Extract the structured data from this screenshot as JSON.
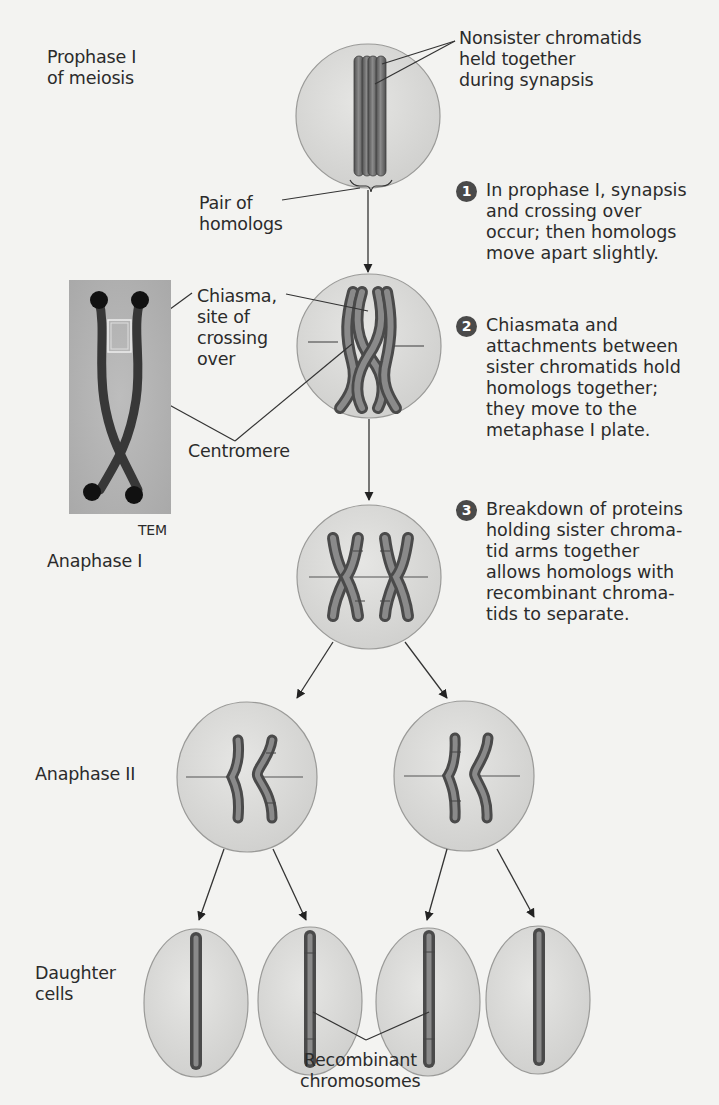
{
  "stages": {
    "prophase": {
      "line1": "Prophase I",
      "line2": "of meiosis"
    },
    "anaphase1": {
      "label": "Anaphase I"
    },
    "anaphase2": {
      "label": "Anaphase II"
    },
    "daughter": {
      "line1": "Daughter",
      "line2": "cells"
    }
  },
  "callouts": {
    "nonsister": {
      "line1": "Nonsister chromatids",
      "line2": "held together",
      "line3": "during synapsis"
    },
    "pair": {
      "line1": "Pair of",
      "line2": "homologs"
    },
    "chiasma": {
      "line1": "Chiasma,",
      "line2": "site of",
      "line3": "crossing",
      "line4": "over"
    },
    "centromere": {
      "label": "Centromere"
    },
    "tem": {
      "label": "TEM"
    },
    "recombinant": {
      "line1": "Recombinant",
      "line2": "chromosomes"
    }
  },
  "steps": [
    {
      "number": "1",
      "lines": [
        "In prophase I, synapsis",
        "and crossing over",
        "occur; then homologs",
        "move apart slightly."
      ]
    },
    {
      "number": "2",
      "lines": [
        "Chiasmata and",
        "attachments between",
        "sister chromatids hold",
        "homologs together;",
        "they move to the",
        "metaphase I plate."
      ]
    },
    {
      "number": "3",
      "lines": [
        "Breakdown of proteins",
        "holding sister chroma-",
        "tid arms together",
        "allows homologs with",
        "recombinant chroma-",
        "tids to separate."
      ]
    }
  ],
  "colors": {
    "cell_fill": "#d9d9d7",
    "cell_stroke": "#9a9a98",
    "chromosome": "#6b6b6b",
    "chromosome_dark": "#4d4d4d",
    "line": "#333333",
    "badge": "#4a4a4a"
  }
}
